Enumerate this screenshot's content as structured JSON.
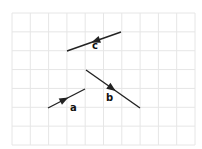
{
  "diagram": {
    "type": "vector-diagram",
    "background": "#ffffff",
    "grid": {
      "x0": 12,
      "y0": 13,
      "x1": 195,
      "y1": 145,
      "cols": 10,
      "rows": 7,
      "line_color": "#e6e6e6"
    },
    "vectors": [
      {
        "name": "a",
        "label": "a",
        "from": [
          48,
          108
        ],
        "to": [
          85,
          89
        ],
        "arrow_at": 0.55,
        "label_pos": [
          70,
          111
        ],
        "color": "#222222"
      },
      {
        "name": "b",
        "label": "b",
        "from": [
          86,
          70
        ],
        "to": [
          140,
          108
        ],
        "arrow_at": 0.55,
        "label_pos": [
          106,
          101
        ],
        "color": "#222222"
      },
      {
        "name": "c",
        "label": "c",
        "from": [
          121,
          32
        ],
        "to": [
          67,
          51
        ],
        "arrow_at": 0.55,
        "label_pos": [
          92,
          49
        ],
        "color": "#222222"
      }
    ]
  }
}
